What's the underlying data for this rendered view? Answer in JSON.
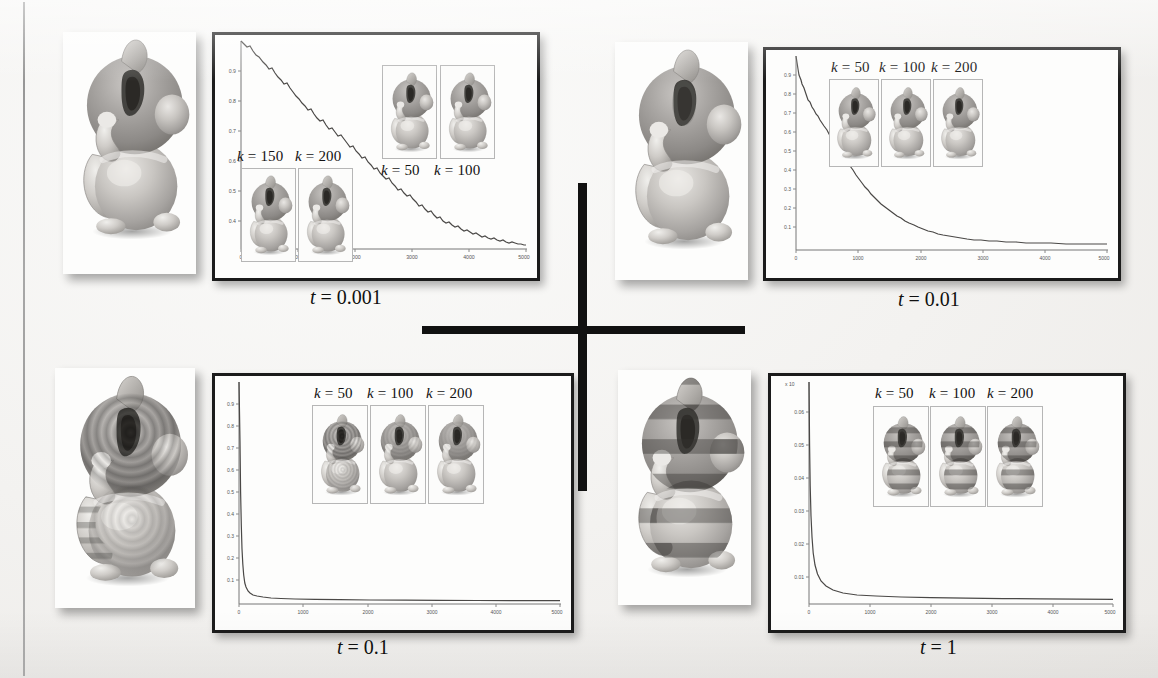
{
  "figure": {
    "kind": "scanned-paper-figure",
    "layout": "2x2 grid of diffusion-time panels separated by a black cross divider",
    "divider_color": "#111111"
  },
  "panels": [
    {
      "id": "t-0p001",
      "caption": "t = 0.001",
      "caption_var": "t",
      "caption_value": "0.001",
      "inset_labels": [
        "k = 150",
        "k = 200",
        "k = 50",
        "k = 100"
      ],
      "k_values": [
        150,
        200,
        50,
        100
      ]
    },
    {
      "id": "t-0p01",
      "caption": "t = 0.01",
      "caption_var": "t",
      "caption_value": "0.01",
      "inset_labels": [
        "k = 50",
        "k = 100",
        "k = 200"
      ],
      "k_values": [
        50,
        100,
        200
      ]
    },
    {
      "id": "t-0p1",
      "caption": "t = 0.1",
      "caption_var": "t",
      "caption_value": "0.1",
      "inset_labels": [
        "k = 50",
        "k = 100",
        "k = 200"
      ],
      "k_values": [
        50,
        100,
        200
      ]
    },
    {
      "id": "t-1",
      "caption": "t = 1",
      "caption_var": "t",
      "caption_value": "1",
      "inset_labels": [
        "k = 50",
        "k = 100",
        "k = 200"
      ],
      "k_values": [
        50,
        100,
        200
      ]
    }
  ],
  "chart_data": [
    {
      "id": "chart-t-0p001",
      "type": "line",
      "title": "",
      "xlabel": "",
      "ylabel": "",
      "xlim": [
        0,
        5000
      ],
      "ylim": [
        0,
        1
      ],
      "xticks": [
        0,
        1000,
        2000,
        3000,
        4000,
        5000
      ],
      "xticklabels": [
        "0",
        "1000",
        "2000",
        "3000",
        "4000",
        "5000"
      ],
      "yticks": [
        0.4,
        0.5,
        0.6,
        0.7,
        0.8,
        0.9
      ],
      "yticklabels": [
        "0.4",
        "0.5",
        "0.6",
        "0.7",
        "0.8",
        "0.9"
      ],
      "grid": false,
      "legend": "none",
      "series": [
        {
          "name": "eigenvalue decay t=0.001",
          "x": [
            0,
            100,
            200,
            350,
            500,
            650,
            800,
            950,
            1100,
            1250,
            1400,
            1500,
            1600,
            1700,
            1800,
            1900,
            2000,
            2150,
            2300,
            2450,
            2600,
            2750,
            2900,
            3050,
            3200,
            3350,
            3500,
            3650,
            3800,
            3950,
            4100,
            4250,
            4400,
            4550,
            4700,
            4850,
            5000
          ],
          "y": [
            1.0,
            0.985,
            0.968,
            0.945,
            0.92,
            0.898,
            0.872,
            0.848,
            0.82,
            0.795,
            0.772,
            0.762,
            0.74,
            0.728,
            0.716,
            0.7,
            0.686,
            0.665,
            0.645,
            0.628,
            0.61,
            0.592,
            0.575,
            0.558,
            0.54,
            0.525,
            0.51,
            0.494,
            0.48,
            0.466,
            0.452,
            0.44,
            0.428,
            0.416,
            0.404,
            0.394,
            0.385
          ]
        }
      ]
    },
    {
      "id": "chart-t-0p01",
      "type": "line",
      "title": "",
      "xlabel": "",
      "ylabel": "",
      "xlim": [
        0,
        5000
      ],
      "ylim": [
        0,
        1
      ],
      "xticks": [
        0,
        1000,
        2000,
        3000,
        4000,
        5000
      ],
      "xticklabels": [
        "0",
        "1000",
        "2000",
        "3000",
        "4000",
        "5000"
      ],
      "yticks": [
        0.1,
        0.2,
        0.3,
        0.4,
        0.5,
        0.6,
        0.7,
        0.8,
        0.9
      ],
      "yticklabels": [
        "0.1",
        "0.2",
        "0.3",
        "0.4",
        "0.5",
        "0.6",
        "0.7",
        "0.8",
        "0.9"
      ],
      "grid": false,
      "legend": "none",
      "series": [
        {
          "name": "eigenvalue decay t=0.01",
          "x": [
            0,
            50,
            100,
            150,
            220,
            300,
            400,
            500,
            620,
            750,
            880,
            1000,
            1150,
            1300,
            1450,
            1600,
            1800,
            2000,
            2250,
            2500,
            2800,
            3100,
            3500,
            4000,
            4500,
            5000
          ],
          "y": [
            1.0,
            0.93,
            0.88,
            0.85,
            0.8,
            0.76,
            0.7,
            0.65,
            0.58,
            0.5,
            0.43,
            0.37,
            0.3,
            0.245,
            0.2,
            0.165,
            0.125,
            0.1,
            0.075,
            0.058,
            0.043,
            0.035,
            0.027,
            0.021,
            0.018,
            0.016
          ]
        }
      ]
    },
    {
      "id": "chart-t-0p1",
      "type": "line",
      "title": "",
      "xlabel": "",
      "ylabel": "",
      "xlim": [
        0,
        5000
      ],
      "ylim": [
        0,
        1
      ],
      "xticks": [
        0,
        1000,
        2000,
        3000,
        4000,
        5000
      ],
      "xticklabels": [
        "0",
        "1000",
        "2000",
        "3000",
        "4000",
        "5000"
      ],
      "yticks": [
        0.1,
        0.2,
        0.3,
        0.4,
        0.5,
        0.6,
        0.7,
        0.8,
        0.9
      ],
      "yticklabels": [
        "0.1",
        "0.2",
        "0.3",
        "0.4",
        "0.5",
        "0.6",
        "0.7",
        "0.8",
        "0.9"
      ],
      "grid": false,
      "legend": "none",
      "series": [
        {
          "name": "eigenvalue decay t=0.1",
          "x": [
            0,
            20,
            40,
            60,
            85,
            110,
            140,
            180,
            230,
            300,
            400,
            600,
            900,
            1400,
            2000,
            3000,
            4000,
            5000
          ],
          "y": [
            1.0,
            0.72,
            0.5,
            0.36,
            0.25,
            0.18,
            0.13,
            0.09,
            0.062,
            0.042,
            0.03,
            0.022,
            0.017,
            0.014,
            0.012,
            0.011,
            0.01,
            0.009
          ]
        }
      ]
    },
    {
      "id": "chart-t-1",
      "type": "line",
      "title": "",
      "xlabel": "",
      "ylabel": "",
      "xlim": [
        0,
        5000
      ],
      "ylim": [
        0,
        0.07
      ],
      "xticks": [
        0,
        1000,
        2000,
        3000,
        4000,
        5000
      ],
      "xticklabels": [
        "0",
        "1000",
        "2000",
        "3000",
        "4000",
        "5000"
      ],
      "yticks": [
        0.01,
        0.02,
        0.03,
        0.04,
        0.05,
        0.06
      ],
      "yticklabels": [
        "0.01",
        "0.02",
        "0.03",
        "0.04",
        "0.05",
        "0.06"
      ],
      "grid": false,
      "legend": "none",
      "series": [
        {
          "name": "eigenvalue decay t=1",
          "x": [
            0,
            10,
            20,
            35,
            55,
            80,
            120,
            200,
            400,
            800,
            1500,
            2500,
            3500,
            5000
          ],
          "y": [
            0.07,
            0.05,
            0.036,
            0.026,
            0.019,
            0.014,
            0.0105,
            0.008,
            0.0065,
            0.0058,
            0.0054,
            0.0052,
            0.005,
            0.005
          ]
        }
      ]
    }
  ]
}
